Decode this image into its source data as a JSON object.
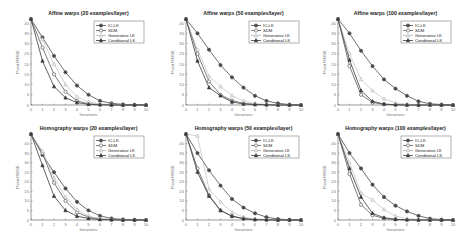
{
  "figure": {
    "layout": {
      "rows": 2,
      "cols": 3
    },
    "colors": {
      "ic_lk": "#4a4a4a",
      "sdm": "#5a5a5a",
      "generative_lk": "#b4b4b4",
      "conditional_lk": "#3a3a3a",
      "axis": "#555555",
      "text": "#222222",
      "tick_text": "#777777"
    }
  },
  "chart_data": [
    {
      "type": "line",
      "title": "Affine warps (20 examples/layer)",
      "xlabel": "Iterations",
      "ylabel": "Point RMSE",
      "x": [
        0,
        1,
        2,
        3,
        4,
        5,
        6,
        7,
        8,
        9,
        10
      ],
      "xticks": [
        "0",
        "1",
        "2",
        "3",
        "4",
        "5",
        "6",
        "7",
        "8",
        "9",
        "10"
      ],
      "yticks": [
        "0",
        "5",
        "10",
        "15",
        "20",
        "25",
        "30",
        "35",
        "40"
      ],
      "xlim": [
        0,
        10
      ],
      "ylim": [
        0,
        42
      ],
      "grid": false,
      "legend_position": "upper right",
      "series": [
        {
          "name": "IC-LK",
          "marker": "circle-filled",
          "values": [
            42,
            33,
            24,
            16,
            9.5,
            5,
            2,
            0.8,
            0.3,
            0.1,
            0
          ]
        },
        {
          "name": "SDM",
          "marker": "circle-open",
          "values": [
            42,
            28,
            15,
            6.5,
            2,
            0.6,
            0.2,
            0.1,
            0,
            0,
            0
          ]
        },
        {
          "name": "Generative LK",
          "marker": "triangle-open",
          "values": [
            42,
            32,
            20,
            10,
            4,
            1.5,
            0.5,
            0.2,
            0.1,
            0,
            0
          ]
        },
        {
          "name": "Conditional LK",
          "marker": "triangle-filled",
          "values": [
            42,
            21.5,
            9,
            3.5,
            1.2,
            0.3,
            0.1,
            0,
            0,
            0,
            0
          ]
        }
      ]
    },
    {
      "type": "line",
      "title": "Affine warps (50 examples/layer)",
      "xlabel": "Iterations",
      "ylabel": "Point RMSE",
      "x": [
        0,
        1,
        2,
        3,
        4,
        5,
        6,
        7,
        8,
        9,
        10
      ],
      "xticks": [
        "0",
        "1",
        "2",
        "3",
        "4",
        "5",
        "6",
        "7",
        "8",
        "9",
        "10"
      ],
      "yticks": [
        "0",
        "5",
        "10",
        "15",
        "20",
        "25",
        "30",
        "35",
        "40"
      ],
      "xlim": [
        0,
        10
      ],
      "ylim": [
        0,
        42
      ],
      "grid": false,
      "legend_position": "upper right",
      "series": [
        {
          "name": "IC-LK",
          "marker": "circle-filled",
          "values": [
            42,
            35,
            27,
            19.5,
            13.5,
            8.5,
            4.5,
            2,
            0.8,
            0.2,
            0
          ]
        },
        {
          "name": "SDM",
          "marker": "circle-open",
          "values": [
            42,
            25,
            11.5,
            5,
            2.2,
            0.8,
            0.3,
            0.1,
            0,
            0,
            0
          ]
        },
        {
          "name": "Generative LK",
          "marker": "triangle-open",
          "values": [
            42,
            27,
            14,
            9,
            4.5,
            2,
            0.8,
            0.3,
            0.1,
            0,
            0
          ]
        },
        {
          "name": "Conditional LK",
          "marker": "triangle-filled",
          "values": [
            42,
            21.5,
            8.5,
            4.5,
            1.5,
            0.5,
            0.2,
            0.1,
            0,
            0,
            0
          ]
        }
      ]
    },
    {
      "type": "line",
      "title": "Affine warps (100 examples/layer)",
      "xlabel": "Iterations",
      "ylabel": "Point RMSE",
      "x": [
        0,
        1,
        2,
        3,
        4,
        5,
        6,
        7,
        8,
        9,
        10
      ],
      "xticks": [
        "0",
        "1",
        "2",
        "3",
        "4",
        "5",
        "6",
        "7",
        "8",
        "9",
        "10"
      ],
      "yticks": [
        "0",
        "5",
        "10",
        "15",
        "20",
        "25",
        "30",
        "35",
        "40"
      ],
      "xlim": [
        0,
        10
      ],
      "ylim": [
        0,
        42
      ],
      "grid": false,
      "legend_position": "upper right",
      "series": [
        {
          "name": "IC-LK",
          "marker": "circle-filled",
          "values": [
            42,
            35,
            26.5,
            19,
            12.5,
            8,
            4.5,
            1.8,
            0.6,
            0.2,
            0
          ]
        },
        {
          "name": "SDM",
          "marker": "circle-open",
          "values": [
            42,
            19,
            5,
            1.2,
            0.3,
            0.1,
            0,
            0,
            0,
            0,
            0
          ]
        },
        {
          "name": "Generative LK",
          "marker": "triangle-open",
          "values": [
            42,
            25,
            12.5,
            7,
            3,
            1,
            0.4,
            0.1,
            0,
            0,
            0
          ]
        },
        {
          "name": "Conditional LK",
          "marker": "triangle-filled",
          "values": [
            42,
            22,
            7,
            1.8,
            0.5,
            0.1,
            0,
            0,
            0,
            0,
            0
          ]
        }
      ]
    },
    {
      "type": "line",
      "title": "Homography warps (20 examples/layer)",
      "xlabel": "Iterations",
      "ylabel": "Point RMSE",
      "x": [
        0,
        1,
        2,
        3,
        4,
        5,
        6,
        7,
        8,
        9,
        10
      ],
      "xticks": [
        "0",
        "1",
        "2",
        "3",
        "4",
        "5",
        "6",
        "7",
        "8",
        "9",
        "10"
      ],
      "yticks": [
        "0",
        "5",
        "10",
        "15",
        "20",
        "25",
        "30",
        "35",
        "40"
      ],
      "xlim": [
        0,
        10
      ],
      "ylim": [
        0,
        45
      ],
      "grid": false,
      "legend_position": "upper right",
      "series": [
        {
          "name": "IC-LK",
          "marker": "circle-filled",
          "values": [
            45,
            34,
            25,
            16.5,
            9.5,
            5,
            2.2,
            0.8,
            0.3,
            0.1,
            0
          ]
        },
        {
          "name": "SDM",
          "marker": "circle-open",
          "values": [
            45,
            35,
            19.5,
            10,
            4,
            1.5,
            0.5,
            0.2,
            0,
            0,
            0
          ]
        },
        {
          "name": "Generative LK",
          "marker": "triangle-open",
          "values": [
            45,
            36,
            22,
            12,
            5.5,
            2,
            0.7,
            0.2,
            0.1,
            0,
            0
          ]
        },
        {
          "name": "Conditional LK",
          "marker": "triangle-filled",
          "values": [
            45,
            28.5,
            12.5,
            5,
            2,
            0.8,
            0.2,
            0.1,
            0,
            0,
            0
          ]
        }
      ]
    },
    {
      "type": "line",
      "title": "Homography warps (50 examples/layer)",
      "xlabel": "Iterations",
      "ylabel": "Point RMSE",
      "x": [
        0,
        1,
        2,
        3,
        4,
        5,
        6,
        7,
        8,
        9,
        10
      ],
      "xticks": [
        "0",
        "1",
        "2",
        "3",
        "4",
        "5",
        "6",
        "7",
        "8",
        "9",
        "10"
      ],
      "yticks": [
        "0",
        "5",
        "10",
        "15",
        "20",
        "25",
        "30",
        "35",
        "40"
      ],
      "xlim": [
        0,
        10
      ],
      "ylim": [
        0,
        45
      ],
      "grid": false,
      "legend_position": "upper right",
      "series": [
        {
          "name": "IC-LK",
          "marker": "circle-filled",
          "values": [
            45,
            35,
            26,
            18,
            11,
            6.5,
            3.5,
            1.5,
            0.5,
            0.1,
            0
          ]
        },
        {
          "name": "SDM",
          "marker": "circle-open",
          "values": [
            45,
            27,
            13,
            5,
            2,
            0.7,
            0.2,
            0.1,
            0,
            0,
            0
          ]
        },
        {
          "name": "Generative LK",
          "marker": "triangle-open",
          "values": [
            45,
            44,
            16,
            9.5,
            4,
            1.5,
            0.5,
            0.2,
            0,
            0,
            0
          ]
        },
        {
          "name": "Conditional LK",
          "marker": "triangle-filled",
          "values": [
            45,
            25,
            12.5,
            5,
            2,
            0.7,
            0.2,
            0.1,
            0,
            0,
            0
          ]
        }
      ]
    },
    {
      "type": "line",
      "title": "Homography warps (100 examples/layer)",
      "xlabel": "Iterations",
      "ylabel": "Point RMSE",
      "x": [
        0,
        1,
        2,
        3,
        4,
        5,
        6,
        7,
        8,
        9,
        10
      ],
      "xticks": [
        "0",
        "1",
        "2",
        "3",
        "4",
        "5",
        "6",
        "7",
        "8",
        "9",
        "10"
      ],
      "yticks": [
        "0",
        "5",
        "10",
        "15",
        "20",
        "25",
        "30",
        "35",
        "40"
      ],
      "xlim": [
        0,
        10
      ],
      "ylim": [
        0,
        45
      ],
      "grid": false,
      "legend_position": "upper right",
      "series": [
        {
          "name": "IC-LK",
          "marker": "circle-filled",
          "values": [
            45,
            35,
            27,
            18.5,
            12,
            7.5,
            4.5,
            2.2,
            0.7,
            0.2,
            0
          ]
        },
        {
          "name": "SDM",
          "marker": "circle-open",
          "values": [
            45,
            24,
            8,
            2.5,
            0.8,
            0.2,
            0.1,
            0,
            0,
            0,
            0
          ]
        },
        {
          "name": "Generative LK",
          "marker": "triangle-open",
          "values": [
            45,
            30,
            14,
            10.5,
            5.5,
            2,
            0.7,
            0.2,
            0,
            0,
            0
          ]
        },
        {
          "name": "Conditional LK",
          "marker": "triangle-filled",
          "values": [
            45,
            27,
            12,
            3.5,
            1.2,
            0.4,
            0.1,
            0,
            0,
            0,
            0
          ]
        }
      ]
    }
  ]
}
